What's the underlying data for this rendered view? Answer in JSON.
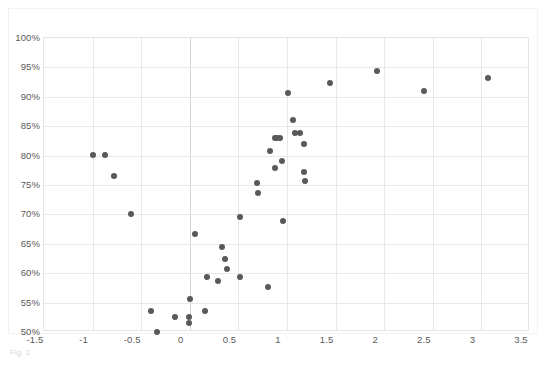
{
  "caption": "Fig. 2",
  "colors": {
    "marker": "#595959",
    "gridline": "#e8e8e8",
    "axis": "#d4d4d4",
    "background": "#ffffff",
    "tick_text": "#5a5a5a"
  },
  "chart_data": {
    "type": "scatter",
    "title": "",
    "xlabel": "",
    "ylabel": "",
    "xlim": [
      -1.5,
      3.5
    ],
    "ylim": [
      0.5,
      1.0
    ],
    "grid": true,
    "legend": "none",
    "x_ticks": [
      -1.5,
      -1,
      -0.5,
      0,
      0.5,
      1,
      1.5,
      2,
      2.5,
      3,
      3.5
    ],
    "x_tick_labels": [
      "-1.5",
      "-1",
      "-0.5",
      "0",
      "0.5",
      "1",
      "1.5",
      "2",
      "2.5",
      "3",
      "3.5"
    ],
    "y_ticks": [
      0.5,
      0.55,
      0.6,
      0.65,
      0.7,
      0.75,
      0.8,
      0.85,
      0.9,
      0.95,
      1.0
    ],
    "y_tick_labels": [
      "50%",
      "55%",
      "60%",
      "65%",
      "70%",
      "75%",
      "80%",
      "85%",
      "90%",
      "95%",
      "100%"
    ],
    "points": [
      [
        -1.0,
        0.801
      ],
      [
        -0.87,
        0.801
      ],
      [
        -0.78,
        0.765
      ],
      [
        -0.6,
        0.7
      ],
      [
        -0.4,
        0.535
      ],
      [
        -0.34,
        0.5
      ],
      [
        -0.15,
        0.525
      ],
      [
        -0.01,
        0.525
      ],
      [
        -0.01,
        0.515
      ],
      [
        0.0,
        0.556
      ],
      [
        0.05,
        0.667
      ],
      [
        0.16,
        0.535
      ],
      [
        0.18,
        0.594
      ],
      [
        0.29,
        0.586
      ],
      [
        0.33,
        0.644
      ],
      [
        0.36,
        0.625
      ],
      [
        0.38,
        0.607
      ],
      [
        0.52,
        0.594
      ],
      [
        0.52,
        0.696
      ],
      [
        0.69,
        0.754
      ],
      [
        0.7,
        0.737
      ],
      [
        0.8,
        0.577
      ],
      [
        0.82,
        0.807
      ],
      [
        0.88,
        0.83
      ],
      [
        0.9,
        0.83
      ],
      [
        0.93,
        0.83
      ],
      [
        0.88,
        0.779
      ],
      [
        0.95,
        0.79
      ],
      [
        0.96,
        0.688
      ],
      [
        1.01,
        0.907
      ],
      [
        1.06,
        0.861
      ],
      [
        1.08,
        0.839
      ],
      [
        1.13,
        0.838
      ],
      [
        1.17,
        0.82
      ],
      [
        1.18,
        0.772
      ],
      [
        1.19,
        0.757
      ],
      [
        1.44,
        0.923
      ],
      [
        1.93,
        0.944
      ],
      [
        2.41,
        0.91
      ],
      [
        3.07,
        0.932
      ]
    ]
  }
}
